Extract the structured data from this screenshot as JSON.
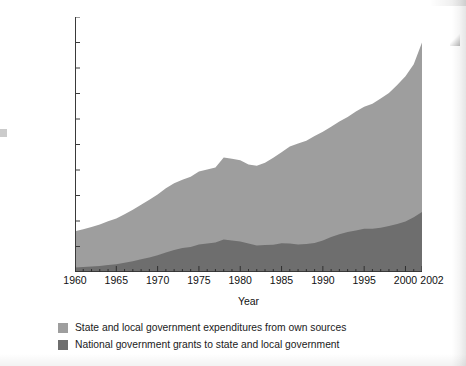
{
  "chart_data": {
    "type": "area",
    "title": "",
    "subtitle": "",
    "xlabel": "Year",
    "ylabel": "Expenditures in billions of constant (1996) dollars",
    "stacked": true,
    "grid": false,
    "legend_position": "bottom-left",
    "xlim": [
      1960,
      2002
    ],
    "ylim": [
      0,
      1000
    ],
    "ytick_labels": [
      "1000",
      "900",
      "800",
      "700",
      "600",
      "500",
      "400",
      "300",
      "200",
      "100",
      "0"
    ],
    "ytick_values": [
      1000,
      900,
      800,
      700,
      600,
      500,
      400,
      300,
      200,
      100,
      0
    ],
    "xtick_labels": [
      "1960",
      "1965",
      "1970",
      "1975",
      "1980",
      "1985",
      "1990",
      "1995",
      "2000",
      "2002"
    ],
    "xtick_values": [
      1960,
      1965,
      1970,
      1975,
      1980,
      1985,
      1990,
      1995,
      2000,
      2002
    ],
    "minor_xticks_every": 1,
    "x": [
      1960,
      1961,
      1962,
      1963,
      1964,
      1965,
      1966,
      1967,
      1968,
      1969,
      1970,
      1971,
      1972,
      1973,
      1974,
      1975,
      1976,
      1977,
      1978,
      1979,
      1980,
      1981,
      1982,
      1983,
      1984,
      1985,
      1986,
      1987,
      1988,
      1989,
      1990,
      1991,
      1992,
      1993,
      1994,
      1995,
      1996,
      1997,
      1998,
      1999,
      2000,
      2001,
      2002
    ],
    "series": [
      {
        "name": "National government grants to state and local government",
        "color": "#6e6e6e",
        "stack_order": 1,
        "values": [
          18,
          20,
          22,
          24,
          27,
          30,
          36,
          42,
          50,
          57,
          66,
          76,
          86,
          94,
          98,
          108,
          112,
          116,
          127,
          124,
          120,
          112,
          104,
          106,
          107,
          113,
          112,
          108,
          110,
          114,
          124,
          137,
          148,
          157,
          163,
          170,
          170,
          174,
          180,
          188,
          198,
          215,
          235
        ]
      },
      {
        "name": "State and local government expenditures from own sources",
        "color": "#9e9e9e",
        "stack_order": 2,
        "values": [
          142,
          148,
          154,
          162,
          172,
          180,
          190,
          202,
          214,
          226,
          238,
          252,
          262,
          268,
          276,
          286,
          290,
          294,
          322,
          320,
          318,
          310,
          313,
          322,
          341,
          357,
          380,
          396,
          405,
          419,
          426,
          433,
          442,
          451,
          466,
          478,
          490,
          506,
          522,
          545,
          570,
          600,
          665
        ]
      }
    ],
    "totals": [
      160,
      168,
      176,
      186,
      199,
      210,
      226,
      244,
      264,
      283,
      304,
      328,
      348,
      362,
      374,
      394,
      402,
      410,
      449,
      444,
      438,
      422,
      417,
      428,
      448,
      470,
      492,
      504,
      515,
      533,
      550,
      570,
      590,
      608,
      629,
      648,
      660,
      680,
      702,
      733,
      768,
      815,
      900
    ]
  },
  "legend": {
    "items": [
      {
        "label": "State and local government expenditures from own sources",
        "color": "#9e9e9e"
      },
      {
        "label": "National government grants to state and local government",
        "color": "#6e6e6e"
      }
    ]
  },
  "axes": {
    "x_title": "Year",
    "y_title": "Expenditures in billions of constant (1996) dollars"
  }
}
